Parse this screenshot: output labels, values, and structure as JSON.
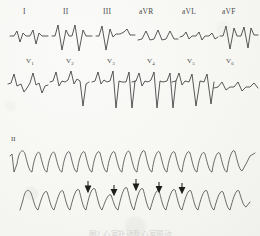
{
  "figure": {
    "kind": "scanned-12-lead-ecg",
    "caption": "图2 心室扑动及心室颤动",
    "caption_visible": "partially-cropped",
    "ink_color": "#3b3b3a",
    "paper_color": "#f8f8f6",
    "marker_color": "#1d1d1c"
  },
  "rows": {
    "limb": {
      "name": "limb-leads-row",
      "leads": [
        {
          "label": "I",
          "label_x": 26,
          "panel_x": 8,
          "panel_w": 42
        },
        {
          "label": "II",
          "label_x": 66,
          "panel_x": 52,
          "panel_w": 42
        },
        {
          "label": "III",
          "label_x": 106,
          "panel_x": 96,
          "panel_w": 40
        },
        {
          "label": "aVR",
          "label_x": 143,
          "panel_x": 138,
          "panel_w": 40
        },
        {
          "label": "aVL",
          "label_x": 185,
          "panel_x": 180,
          "panel_w": 38
        },
        {
          "label": "aVF",
          "label_x": 225,
          "panel_x": 220,
          "panel_w": 38
        }
      ]
    },
    "precordial": {
      "name": "precordial-leads-row",
      "leads": [
        {
          "label": "V",
          "sub": "1",
          "label_x": 28,
          "panel_x": 8,
          "panel_w": 40
        },
        {
          "label": "V",
          "sub": "2",
          "label_x": 69,
          "panel_x": 50,
          "panel_w": 40
        },
        {
          "label": "V",
          "sub": "3",
          "label_x": 110,
          "panel_x": 92,
          "panel_w": 40
        },
        {
          "label": "V",
          "sub": "4",
          "label_x": 150,
          "panel_x": 132,
          "panel_w": 40
        },
        {
          "label": "V",
          "sub": "5",
          "label_x": 190,
          "panel_x": 172,
          "panel_w": 40
        },
        {
          "label": "V",
          "sub": "6",
          "label_x": 228,
          "panel_x": 212,
          "panel_w": 44
        }
      ]
    },
    "rhythm_top": {
      "name": "rhythm-strip-upper",
      "label": "II",
      "label_x": 12,
      "beats": 13,
      "description": "regular wide sine-like ventricular flutter waves"
    },
    "rhythm_bottom": {
      "name": "rhythm-strip-lower",
      "label": "",
      "beats": 12,
      "description": "irregular coarse ventricular fibrillation waves with marker arrows",
      "arrows": [
        {
          "x": 88,
          "y": 183,
          "len": 9
        },
        {
          "x": 114,
          "y": 187,
          "len": 9
        },
        {
          "x": 136,
          "y": 181,
          "len": 9
        },
        {
          "x": 159,
          "y": 184,
          "len": 9
        },
        {
          "x": 182,
          "y": 185,
          "len": 9
        }
      ]
    }
  }
}
